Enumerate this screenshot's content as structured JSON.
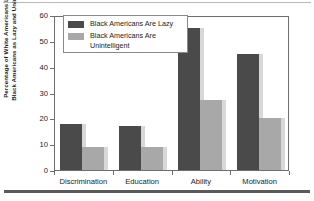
{
  "chart_data": {
    "type": "bar",
    "title": "",
    "xlabel": "",
    "ylabel": "Percentage of White Americans Labeling Black Americans as Lazy and Unintelligent",
    "ylabel_line1": "Percentage of White Americans Labeling",
    "ylabel_line2": "Black Americans as Lazy and Unintelligent",
    "categories": [
      "Discrimination",
      "Education",
      "Ability",
      "Motivation"
    ],
    "series": [
      {
        "name": "Black Americans Are Lazy",
        "color": "#4a4a4a",
        "values": [
          18,
          17,
          55,
          45
        ]
      },
      {
        "name": "Black Americans Are Unintelligent",
        "color": "#a8a8a8",
        "values": [
          9,
          9,
          27,
          20
        ]
      }
    ],
    "ylim": [
      0,
      60
    ],
    "yticks": [
      0,
      10,
      20,
      30,
      40,
      50,
      60
    ],
    "ytick_labels": [
      "0",
      "10",
      "20",
      "30",
      "40",
      "50",
      "60"
    ],
    "grid": false,
    "legend_position": "top-left",
    "legend_entries": [
      "Black Americans Are Lazy",
      "Black Americans Are\nUnintelligent"
    ]
  }
}
